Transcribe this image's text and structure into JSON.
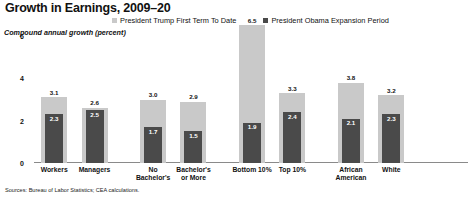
{
  "chart_data": {
    "type": "bar",
    "title": "Growth in Earnings, 2009–20",
    "ylabel": "Compound annual growth (percent)",
    "xlabel": "",
    "ylim": [
      0,
      6
    ],
    "yticks": [
      "6",
      "4",
      "2",
      "0"
    ],
    "ytick_values": [
      6,
      4,
      2,
      0
    ],
    "grid": false,
    "legend_position": "top",
    "categories": [
      "Workers",
      "Managers",
      "",
      "No Bachelor's",
      "Bachelor's or More",
      "",
      "Bottom 10%",
      "Top 10%",
      "",
      "African American",
      "White"
    ],
    "category_lines": [
      [
        "Workers"
      ],
      [
        "Managers"
      ],
      [
        ""
      ],
      [
        "No",
        "Bachelor's"
      ],
      [
        "Bachelor's",
        "or More"
      ],
      [
        ""
      ],
      [
        "Bottom 10%"
      ],
      [
        "Top 10%"
      ],
      [
        ""
      ],
      [
        "African",
        "American"
      ],
      [
        "White"
      ]
    ],
    "series": [
      {
        "name": "President Trump First Term To Date",
        "color": "#c9c9c9",
        "values": [
          3.1,
          2.6,
          null,
          3.0,
          2.9,
          null,
          6.5,
          3.3,
          null,
          3.8,
          3.2
        ],
        "labels": [
          "3.1",
          "2.6",
          "",
          "3.0",
          "2.9",
          "",
          "6.5",
          "3.3",
          "",
          "3.8",
          "3.2"
        ]
      },
      {
        "name": "President Obama Expansion Period",
        "color": "#4a4a4a",
        "values": [
          2.3,
          2.5,
          null,
          1.7,
          1.5,
          null,
          1.9,
          2.4,
          null,
          2.1,
          2.3
        ],
        "labels": [
          "2.3",
          "2.5",
          "",
          "1.7",
          "1.5",
          "",
          "1.9",
          "2.4",
          "",
          "2.1",
          "2.3"
        ]
      }
    ],
    "source_note": "Sources: Bureau of Labor Statistics; CEA calculations."
  },
  "legend": {
    "items": [
      {
        "label": "President Trump First Term To Date",
        "color": "#c9c9c9"
      },
      {
        "label": "President Obama Expansion Period",
        "color": "#4a4a4a"
      }
    ]
  },
  "colors": {
    "light_bar": "#c9c9c9",
    "dark_bar": "#4a4a4a",
    "axis": "#8a8a8a",
    "text": "#111111"
  }
}
